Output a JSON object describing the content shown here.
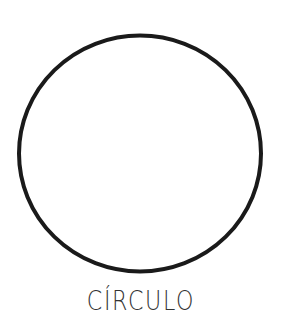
{
  "figure": {
    "shape": "circle",
    "label": "CÍRCULO",
    "stroke_color": "#1a1a1a",
    "fill_color": "#ffffff"
  }
}
